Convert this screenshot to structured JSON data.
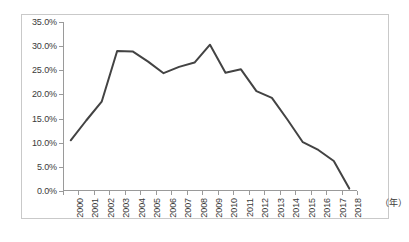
{
  "chart_data": {
    "type": "line",
    "title": "",
    "xlabel": "（年）",
    "ylabel": "",
    "categories": [
      "2000",
      "2001",
      "2002",
      "2003",
      "2004",
      "2005",
      "2006",
      "2007",
      "2008",
      "2009",
      "2010",
      "2011",
      "2012",
      "2013",
      "2014",
      "2015",
      "2016",
      "2017",
      "2018"
    ],
    "values": [
      10.5,
      14.6,
      18.5,
      29.0,
      28.9,
      26.8,
      24.4,
      25.7,
      26.6,
      30.3,
      24.5,
      25.2,
      20.7,
      19.3,
      14.8,
      10.1,
      8.5,
      6.2,
      0.5
    ],
    "series": [
      {
        "name": "",
        "values": [
          10.5,
          14.6,
          18.5,
          29.0,
          28.9,
          26.8,
          24.4,
          25.7,
          26.6,
          30.3,
          24.5,
          25.2,
          20.7,
          19.3,
          14.8,
          10.1,
          8.5,
          6.2,
          0.5
        ]
      }
    ],
    "ylim": [
      0,
      35
    ],
    "y_ticks": [
      0,
      5,
      10,
      15,
      20,
      25,
      30,
      35
    ],
    "y_tick_labels": [
      "0.0%",
      "5.0%",
      "10.0%",
      "15.0%",
      "20.0%",
      "25.0%",
      "30.0%",
      "35.0%"
    ],
    "grid": false,
    "legend": "none",
    "line_color": "#434343",
    "axis_color": "#9a9a9a",
    "border_color": "#c9c9c9",
    "background_color": "#ffffff"
  }
}
